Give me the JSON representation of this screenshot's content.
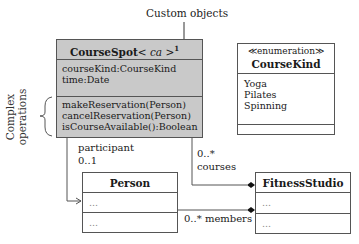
{
  "annotations": {
    "custom_objects": "Custom objects",
    "complex_operations_line1": "Complex",
    "complex_operations_line2": "operations"
  },
  "classes": {
    "course_spot": {
      "name": "CourseSpot",
      "type_param": "< ca >",
      "superscript": "1",
      "attributes": [
        "courseKind:CourseKind",
        "time:Date"
      ],
      "operations": [
        "makeReservation(Person)",
        "cancelReservation(Person)",
        "isCourseAvailable():Boolean"
      ],
      "fill": "#c9c9c9"
    },
    "course_kind": {
      "stereotype": "≪enumeration≫",
      "name": "CourseKind",
      "literals": [
        "Yoga",
        "Pilates",
        "Spinning"
      ]
    },
    "person": {
      "name": "Person",
      "sections": [
        "...",
        "..."
      ]
    },
    "fitness_studio": {
      "name": "FitnessStudio",
      "sections": [
        "...",
        "..."
      ]
    }
  },
  "associations": {
    "participant": {
      "role": "participant",
      "multiplicity": "0..1"
    },
    "courses": {
      "role": "courses",
      "multiplicity": "0..*"
    },
    "members": {
      "role": "members",
      "multiplicity": "0..*",
      "label": "0..* members"
    }
  }
}
